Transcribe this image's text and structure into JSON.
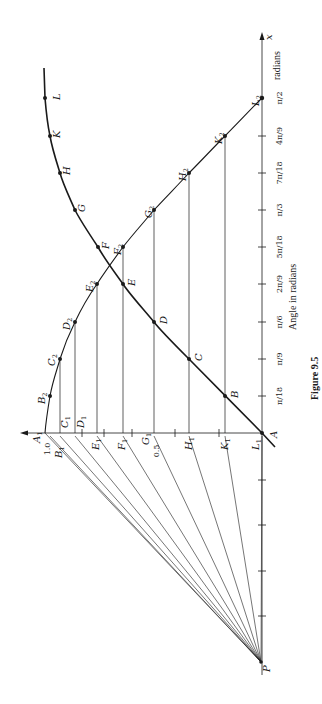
{
  "figure": {
    "caption": "Figure 9.5",
    "x_axis_title": "Angle in radians",
    "x_axis_end_label": "x",
    "x_axis_end_unit": "radians",
    "colors": {
      "ink": "#1a1a1a",
      "paper": "#ffffff"
    }
  },
  "x_axis": {
    "ticks": [
      {
        "label": "π/18",
        "num": "π",
        "den": "18",
        "coef": "",
        "pos": 396
      },
      {
        "label": "π/9",
        "num": "π",
        "den": "9",
        "coef": "",
        "pos": 359
      },
      {
        "label": "π/6",
        "num": "π",
        "den": "6",
        "coef": "",
        "pos": 322
      },
      {
        "label": "2π/9",
        "num": "π",
        "den": "9",
        "coef": "2",
        "pos": 284
      },
      {
        "label": "5π/18",
        "num": "π",
        "den": "18",
        "coef": "5",
        "pos": 247
      },
      {
        "label": "π/3",
        "num": "π",
        "den": "3",
        "coef": "",
        "pos": 210
      },
      {
        "label": "7π/18",
        "num": "π",
        "den": "18",
        "coef": "7",
        "pos": 173
      },
      {
        "label": "4π/9",
        "num": "π",
        "den": "9",
        "coef": "4",
        "pos": 136
      },
      {
        "label": "π/2",
        "num": "π",
        "den": "2",
        "coef": "",
        "pos": 98
      }
    ]
  },
  "y_axis": {
    "value_labels": [
      {
        "label": "1.0",
        "value": 1.0
      },
      {
        "label": "0.5",
        "value": 0.5
      }
    ]
  },
  "points": {
    "origin": "A",
    "pole": "P",
    "curve_sin": [
      "A",
      "B",
      "C",
      "D",
      "E",
      "F",
      "G",
      "H",
      "K",
      "L"
    ],
    "curve_cos": [
      "B2",
      "C2",
      "D2",
      "E2",
      "F2",
      "G2",
      "H2",
      "K2",
      "L2"
    ],
    "axis_marks": [
      "A1",
      "B1",
      "C1",
      "D1",
      "E1",
      "F1",
      "G1",
      "H1",
      "K1",
      "L1"
    ]
  },
  "labels": {
    "A": "A",
    "B": "B",
    "C": "C",
    "D": "D",
    "E": "E",
    "F": "F",
    "G": "G",
    "H": "H",
    "K": "K",
    "L": "L",
    "P": "P",
    "B2": "B",
    "C2": "C",
    "D2": "D",
    "E2": "E",
    "F2": "F",
    "G2": "G",
    "H2": "H",
    "K2": "K",
    "L2": "L",
    "A1": "A",
    "B1": "B",
    "C1": "C",
    "D1": "D",
    "E1": "E",
    "F1": "F",
    "G1": "G",
    "H1": "H",
    "K1": "K",
    "L1": "L",
    "sub1": "1",
    "sub2": "2"
  }
}
